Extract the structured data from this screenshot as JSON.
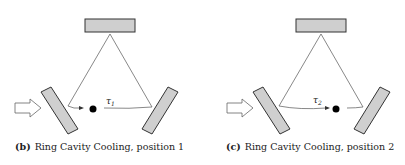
{
  "figure": {
    "panels": [
      {
        "id": "b",
        "label": "(b)",
        "caption": "Ring Cavity Cooling, position 1",
        "particle_label": "τ",
        "particle_subscript": "1",
        "particle_position": "left of centre on lower beam path"
      },
      {
        "id": "c",
        "label": "(c)",
        "caption": "Ring Cavity Cooling, position 2",
        "particle_label": "τ",
        "particle_subscript": "2",
        "particle_position": "right of centre on lower beam path"
      }
    ],
    "colors": {
      "mirror_fill": "#cfcfcf",
      "mirror_stroke": "#333333",
      "beam": "#555555",
      "particle": "#000000"
    }
  }
}
